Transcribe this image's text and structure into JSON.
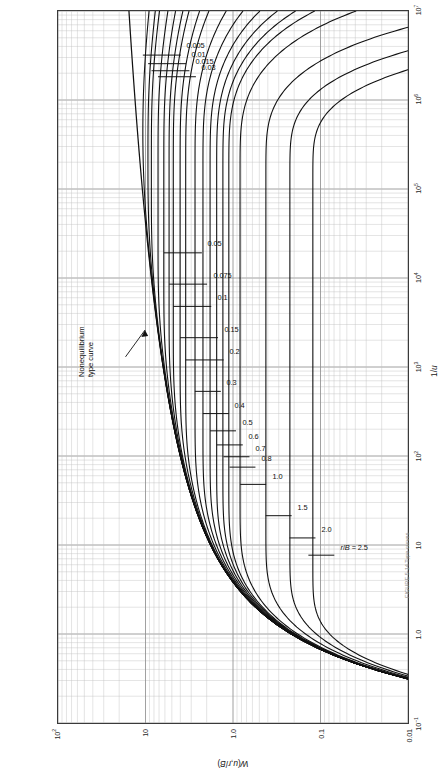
{
  "figure": {
    "kind": "log-log type-curve family",
    "annotation_line1": "Nonequilibrium",
    "annotation_line2": "type curve",
    "caption": "FIGURE 5-14  Type curves"
  },
  "chart_data": {
    "type": "line",
    "title": "",
    "xlabel": "1/u",
    "ylabel": "W(u,r/B)",
    "xscale": "log",
    "yscale": "log",
    "xlim": [
      0.1,
      10000000
    ],
    "ylim": [
      0.01,
      100
    ],
    "grid": true,
    "legend": "inline curve labels",
    "xticks": [
      "10⁻¹",
      "1.0",
      "10",
      "10²",
      "10³",
      "10⁴",
      "10⁵",
      "10⁶",
      "10⁷"
    ],
    "xtick_values": [
      0.1,
      1,
      10,
      100,
      1000,
      10000,
      100000,
      1000000,
      10000000
    ],
    "yticks": [
      "0.01",
      "0.1",
      "1.0",
      "10",
      "10²"
    ],
    "ytick_values": [
      0.01,
      0.1,
      1,
      10,
      100
    ],
    "series_label_prefix": "r/B = ",
    "series": [
      {
        "name": "0.005",
        "r_over_B": 0.005,
        "plateau": 10.8
      },
      {
        "name": "0.01",
        "r_over_B": 0.01,
        "plateau": 9.4
      },
      {
        "name": "0.015",
        "r_over_B": 0.015,
        "plateau": 8.6
      },
      {
        "name": "0.03",
        "r_over_B": 0.03,
        "plateau": 7.25
      },
      {
        "name": "0.05",
        "r_over_B": 0.05,
        "plateau": 6.2
      },
      {
        "name": "0.075",
        "r_over_B": 0.075,
        "plateau": 5.4
      },
      {
        "name": "0.1",
        "r_over_B": 0.1,
        "plateau": 4.85
      },
      {
        "name": "0.15",
        "r_over_B": 0.15,
        "plateau": 4.05
      },
      {
        "name": "0.2",
        "r_over_B": 0.2,
        "plateau": 3.5
      },
      {
        "name": "0.3",
        "r_over_B": 0.3,
        "plateau": 2.75
      },
      {
        "name": "0.4",
        "r_over_B": 0.4,
        "plateau": 2.23
      },
      {
        "name": "0.5",
        "r_over_B": 0.5,
        "plateau": 1.85
      },
      {
        "name": "0.6",
        "r_over_B": 0.6,
        "plateau": 1.55
      },
      {
        "name": "0.7",
        "r_over_B": 0.7,
        "plateau": 1.3
      },
      {
        "name": "0.8",
        "r_over_B": 0.8,
        "plateau": 1.11
      },
      {
        "name": "1.0",
        "r_over_B": 1.0,
        "plateau": 0.84
      },
      {
        "name": "1.5",
        "r_over_B": 1.5,
        "plateau": 0.43
      },
      {
        "name": "2.0",
        "r_over_B": 2.0,
        "plateau": 0.23
      },
      {
        "name": "2.5",
        "r_over_B": 2.5,
        "plateau": 0.14
      }
    ],
    "nonequilibrium_curve": {
      "name": "Nonequilibrium type curve",
      "description": "Theis W(u) curve, the envelope the r/B family departs from"
    }
  }
}
